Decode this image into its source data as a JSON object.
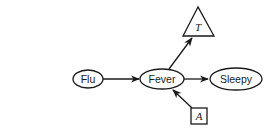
{
  "diagram": {
    "type": "influence-diagram",
    "nodes": [
      {
        "id": "flu",
        "label": "Flu",
        "shape": "ellipse",
        "kind": "chance"
      },
      {
        "id": "fever",
        "label": "Fever",
        "shape": "ellipse",
        "kind": "chance"
      },
      {
        "id": "sleepy",
        "label": "Sleepy",
        "shape": "ellipse",
        "kind": "chance"
      },
      {
        "id": "t",
        "label": "T",
        "shape": "triangle",
        "kind": "utility"
      },
      {
        "id": "a",
        "label": "A",
        "shape": "rectangle",
        "kind": "decision"
      }
    ],
    "edges": [
      {
        "from": "flu",
        "to": "fever"
      },
      {
        "from": "fever",
        "to": "sleepy"
      },
      {
        "from": "fever",
        "to": "t"
      },
      {
        "from": "a",
        "to": "fever"
      }
    ],
    "colors": {
      "stroke": "#1a1a1a",
      "fill": "#ffffff",
      "background": "#ffffff"
    }
  }
}
